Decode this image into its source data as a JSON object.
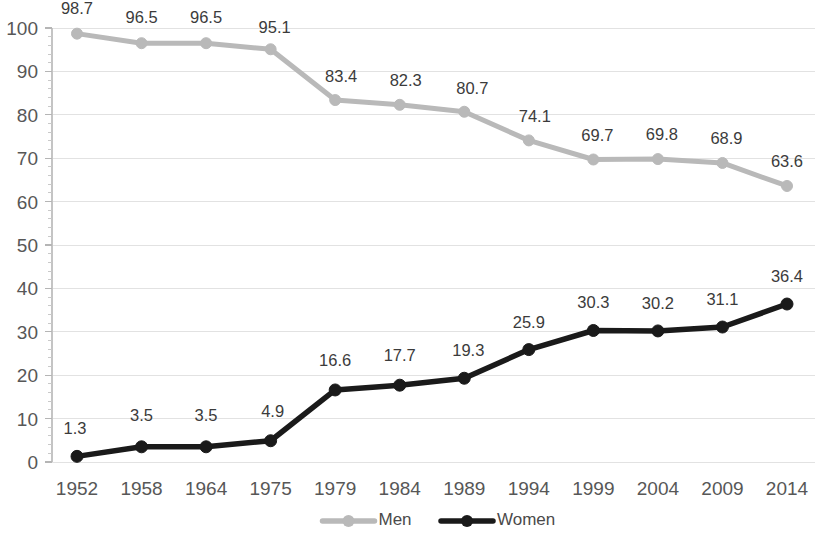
{
  "chart_data": {
    "type": "line",
    "title": "",
    "subtitle": "",
    "xlabel": "",
    "ylabel": "",
    "categories": [
      "1952",
      "1958",
      "1964",
      "1975",
      "1979",
      "1984",
      "1989",
      "1994",
      "1999",
      "2004",
      "2009",
      "2014"
    ],
    "series": [
      {
        "name": "Men",
        "color": "#b9b9b9",
        "marker": "circle",
        "values": [
          98.7,
          96.5,
          96.5,
          95.1,
          83.4,
          82.3,
          80.7,
          74.1,
          69.7,
          69.8,
          68.9,
          63.6
        ],
        "labels": [
          "98.7",
          "96.5",
          "96.5",
          "95.1",
          "83.4",
          "82.3",
          "80.7",
          "74.1",
          "69.7",
          "69.8",
          "68.9",
          "63.6"
        ]
      },
      {
        "name": "Women",
        "color": "#1a1a1a",
        "marker": "circle",
        "values": [
          1.3,
          3.5,
          3.5,
          4.9,
          16.6,
          17.7,
          19.3,
          25.9,
          30.3,
          30.2,
          31.1,
          36.4
        ],
        "labels": [
          "1.3",
          "3.5",
          "3.5",
          "4.9",
          "16.6",
          "17.7",
          "19.3",
          "25.9",
          "30.3",
          "30.2",
          "31.1",
          "36.4"
        ]
      }
    ],
    "ylim": [
      0,
      100
    ],
    "ytick_values": [
      0,
      10,
      20,
      30,
      40,
      50,
      60,
      70,
      80,
      90,
      100
    ],
    "ytick_labels": [
      "0",
      "10",
      "20",
      "30",
      "40",
      "50",
      "60",
      "70",
      "80",
      "90",
      "100"
    ],
    "y_minor_step": 2,
    "grid": true,
    "grid_axis": "y",
    "legend_position": "bottom",
    "legend_entries": [
      {
        "label": "Men",
        "color": "#b9b9b9"
      },
      {
        "label": "Women",
        "color": "#1a1a1a"
      }
    ],
    "data_labels_shown": true,
    "background_color": "#ffffff",
    "gridline_color": "#e2e2e2",
    "axis_color": "#c4c4c4",
    "tick_label_color": "#575757",
    "data_label_color": "#3b3b3b"
  }
}
